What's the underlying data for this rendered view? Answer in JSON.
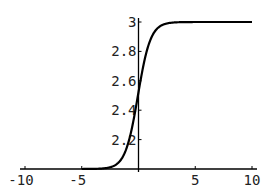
{
  "chart_data": {
    "type": "line",
    "title": "",
    "xlabel": "",
    "ylabel": "",
    "xlim": [
      -10,
      10
    ],
    "ylim": [
      2.0,
      3.0
    ],
    "x_ticks": [
      -10,
      -5,
      5,
      10
    ],
    "x_tick_labels": [
      "-10",
      "-5",
      "5",
      "10"
    ],
    "y_ticks": [
      2.2,
      2.4,
      2.6,
      2.8,
      3
    ],
    "y_tick_labels": [
      "2.2",
      "2.4",
      "2.6",
      "2.8",
      "3"
    ],
    "grid": false,
    "legend": null,
    "axes_origin": [
      0,
      2.0
    ],
    "series": [
      {
        "name": "sigmoid",
        "color": "#000000",
        "x": [
          -10,
          -5,
          -4,
          -3,
          -2,
          -1.5,
          -1,
          -0.5,
          0,
          0.5,
          1,
          1.5,
          2,
          3,
          4,
          5,
          10
        ],
        "values": [
          2.0,
          2.0,
          2.0,
          2.005,
          2.03,
          2.06,
          2.14,
          2.29,
          2.5,
          2.71,
          2.86,
          2.94,
          2.97,
          2.995,
          3.0,
          3.0,
          3.0
        ]
      }
    ]
  }
}
